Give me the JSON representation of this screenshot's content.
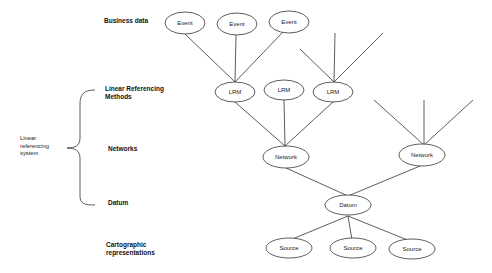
{
  "levels": {
    "business": "Business data",
    "lrm_line1": "Linear Referencing",
    "lrm_line2": "Methods",
    "networks": "Networks",
    "datum": "Datum",
    "carto_line1": "Cartographic",
    "carto_line2": "representations"
  },
  "side_label": {
    "line1": "Linear",
    "line2": "referencing",
    "line3": "system"
  },
  "nodes": {
    "events": [
      "Event",
      "Event",
      "Event"
    ],
    "lrms": [
      "LRM",
      "LRM",
      "LRM"
    ],
    "networks": [
      "Network",
      "Network"
    ],
    "datum": "Datum",
    "sources": [
      "Source",
      "Source",
      "Source"
    ]
  }
}
